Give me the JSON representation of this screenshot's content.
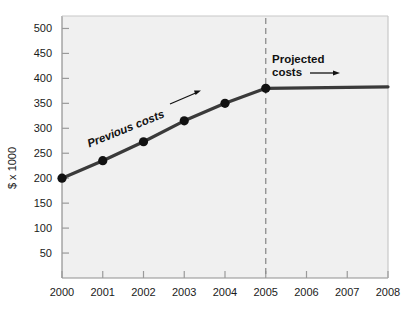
{
  "chart_data": {
    "type": "line",
    "title": "",
    "xlabel": "",
    "ylabel": "$ x 1000",
    "x": [
      2000,
      2001,
      2002,
      2003,
      2004,
      2005,
      2006,
      2007,
      2008
    ],
    "xtick_labels": [
      "2000",
      "2001",
      "2002",
      "2003",
      "2004",
      "2005",
      "2006",
      "2007",
      "2008"
    ],
    "xlim": [
      2000,
      2008
    ],
    "ytick_labels": [
      "50",
      "100",
      "150",
      "200",
      "250",
      "300",
      "350",
      "400",
      "450",
      "500"
    ],
    "yticks": [
      50,
      100,
      150,
      200,
      250,
      300,
      350,
      400,
      450,
      500
    ],
    "ylim": [
      0,
      525
    ],
    "grid": false,
    "legend_position": "none",
    "series": [
      {
        "name": "Previous costs",
        "style": "solid-with-markers",
        "x": [
          2000,
          2001,
          2002,
          2003,
          2004,
          2005
        ],
        "values": [
          200,
          235,
          273,
          315,
          350,
          380
        ]
      },
      {
        "name": "Projected costs",
        "style": "solid-no-markers",
        "x": [
          2005,
          2008
        ],
        "values": [
          380,
          383
        ]
      }
    ],
    "annotations": [
      {
        "id": "previous-costs-label",
        "text": "Previous costs",
        "x": 2001.6,
        "y": 292,
        "rotation": -22,
        "arrow": "up-right"
      },
      {
        "id": "projected-costs-label",
        "text_line1": "Projected",
        "text_line2": "costs",
        "x": 2005.4,
        "y": 440,
        "arrow": "right"
      }
    ],
    "reference_lines": [
      {
        "id": "projection-divider",
        "orientation": "vertical",
        "x": 2005,
        "style": "dashed"
      }
    ],
    "colors": {
      "plot_background": "#f0f0f0",
      "series_line": "#3a3a3a",
      "marker": "#111111",
      "axis": "#9a9a9a",
      "text": "#1a1a1a",
      "divider": "#8c8c8c"
    }
  }
}
